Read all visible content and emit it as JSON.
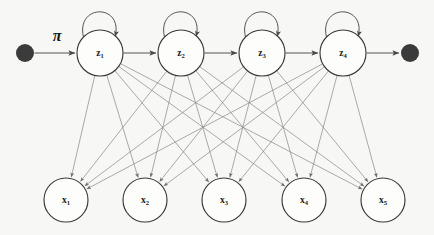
{
  "figure": {
    "type": "diagram",
    "background_color": "#f7f7f5",
    "width": 434,
    "height": 235
  },
  "colors": {
    "node_fill": "#fdfdfb",
    "node_stroke": "#3a3a3a",
    "terminal_dot": "#3b3b3b",
    "chain_edge": "#555555",
    "emission_edge": "#8a8a8a",
    "label_text": "#1d1d1d"
  },
  "labels": {
    "initial_distribution": "π"
  },
  "hidden_states": [
    {
      "id": "z1",
      "base": "z",
      "sub": "1",
      "cx": 100,
      "cy": 53,
      "r": 23
    },
    {
      "id": "z2",
      "base": "z",
      "sub": "2",
      "cx": 181,
      "cy": 53,
      "r": 23
    },
    {
      "id": "z3",
      "base": "z",
      "sub": "3",
      "cx": 262,
      "cy": 53,
      "r": 23
    },
    {
      "id": "z4",
      "base": "z",
      "sub": "4",
      "cx": 343,
      "cy": 53,
      "r": 23
    }
  ],
  "observations": [
    {
      "id": "x1",
      "base": "x",
      "sub": "1",
      "cx": 66,
      "cy": 200,
      "r": 22
    },
    {
      "id": "x2",
      "base": "x",
      "sub": "2",
      "cx": 145,
      "cy": 200,
      "r": 22
    },
    {
      "id": "x3",
      "base": "x",
      "sub": "3",
      "cx": 224,
      "cy": 200,
      "r": 22
    },
    {
      "id": "x4",
      "base": "x",
      "sub": "4",
      "cx": 304,
      "cy": 200,
      "r": 22
    },
    {
      "id": "x5",
      "base": "x",
      "sub": "5",
      "cx": 383,
      "cy": 200,
      "r": 22
    }
  ],
  "terminals": [
    {
      "id": "start-dot",
      "cx": 25,
      "cy": 53,
      "r": 9
    },
    {
      "id": "end-dot",
      "cx": 410,
      "cy": 53,
      "r": 9
    }
  ],
  "chain_edges": [
    {
      "from": "start-dot",
      "to": "z1"
    },
    {
      "from": "z1",
      "to": "z2"
    },
    {
      "from": "z2",
      "to": "z3"
    },
    {
      "from": "z3",
      "to": "z4"
    },
    {
      "from": "z4",
      "to": "end-dot"
    }
  ],
  "self_loops": [
    "z1",
    "z2",
    "z3",
    "z4"
  ],
  "emission_edges": [
    {
      "from": "z1",
      "to": "x1"
    },
    {
      "from": "z1",
      "to": "x2"
    },
    {
      "from": "z1",
      "to": "x3"
    },
    {
      "from": "z1",
      "to": "x4"
    },
    {
      "from": "z1",
      "to": "x5"
    },
    {
      "from": "z2",
      "to": "x1"
    },
    {
      "from": "z2",
      "to": "x2"
    },
    {
      "from": "z2",
      "to": "x3"
    },
    {
      "from": "z2",
      "to": "x4"
    },
    {
      "from": "z2",
      "to": "x5"
    },
    {
      "from": "z3",
      "to": "x1"
    },
    {
      "from": "z3",
      "to": "x2"
    },
    {
      "from": "z3",
      "to": "x3"
    },
    {
      "from": "z3",
      "to": "x4"
    },
    {
      "from": "z3",
      "to": "x5"
    },
    {
      "from": "z4",
      "to": "x1"
    },
    {
      "from": "z4",
      "to": "x2"
    },
    {
      "from": "z4",
      "to": "x3"
    },
    {
      "from": "z4",
      "to": "x4"
    },
    {
      "from": "z4",
      "to": "x5"
    }
  ]
}
